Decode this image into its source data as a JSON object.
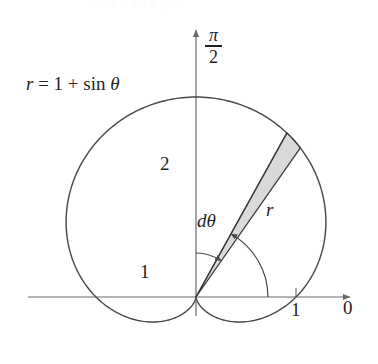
{
  "figure": {
    "title_cropped": "r = 1 + sin θ , the",
    "background_color": "#ffffff",
    "stroke_color": "#4a4a4a",
    "axis_color": "#6b6b6b",
    "text_color": "#1f1f1f",
    "wedge_fill_color": "#d9d9d9",
    "wedge_stroke_color": "#3a3a3a"
  },
  "labels": {
    "equation_r": "r",
    "equation_eq": " = 1 + ",
    "equation_fn": "sin",
    "equation_theta": " θ",
    "vertical_axis_numerator": "π",
    "vertical_axis_denominator": "2",
    "value_two": "2",
    "value_one_left": "1",
    "value_one_axis": "1",
    "polar_axis_zero": "0",
    "differential_theta": "dθ",
    "radius": "r"
  },
  "chart_data": {
    "type": "line",
    "title": "r = 1 + sin θ",
    "coordinate_system": "polar",
    "curve_name": "cardioid",
    "equation": "r = 1 + sin(theta)",
    "xlabel": "0",
    "ylabel": "π/2",
    "grid": false,
    "legend": "none",
    "axes": {
      "horizontal_label": "0",
      "vertical_label": "π/2",
      "horizontal_tick_values": [
        1
      ],
      "vertical_tick_values": [
        2
      ],
      "unit_pixels": 100,
      "origin_px": [
        196,
        297
      ]
    },
    "annotations": [
      {
        "text": "r = 1 + sin θ",
        "role": "curve-equation",
        "px": [
          26,
          74
        ]
      },
      {
        "text": "2",
        "role": "vertical-extent-value",
        "px": [
          160,
          154
        ]
      },
      {
        "text": "1",
        "role": "left-lobe-value",
        "px": [
          140,
          262
        ]
      },
      {
        "text": "1",
        "role": "horizontal-tick-value",
        "px": [
          291,
          300
        ]
      },
      {
        "text": "0",
        "role": "polar-axis-label",
        "px": [
          343,
          298
        ]
      },
      {
        "text": "dθ",
        "role": "angle-increment",
        "px": [
          197,
          211
        ]
      },
      {
        "text": "r",
        "role": "radius-segment",
        "px": [
          266,
          200
        ]
      },
      {
        "text": "π/2",
        "role": "vertical-axis-label",
        "px": [
          205,
          26
        ]
      }
    ],
    "shaded_region": {
      "shape": "sector",
      "description": "thin shaded sector of angular width dθ and radius r",
      "theta_center_deg": 58,
      "theta_width_deg": 6,
      "fill": "#d9d9d9"
    },
    "sampled_points_polar": [
      {
        "theta_deg": 0,
        "r": 1.0
      },
      {
        "theta_deg": 30,
        "r": 1.5
      },
      {
        "theta_deg": 60,
        "r": 1.866
      },
      {
        "theta_deg": 90,
        "r": 2.0
      },
      {
        "theta_deg": 120,
        "r": 1.866
      },
      {
        "theta_deg": 150,
        "r": 1.5
      },
      {
        "theta_deg": 180,
        "r": 1.0
      },
      {
        "theta_deg": 210,
        "r": 0.5
      },
      {
        "theta_deg": 240,
        "r": 0.134
      },
      {
        "theta_deg": 270,
        "r": 0.0
      },
      {
        "theta_deg": 300,
        "r": 0.134
      },
      {
        "theta_deg": 330,
        "r": 0.5
      },
      {
        "theta_deg": 360,
        "r": 1.0
      }
    ]
  }
}
